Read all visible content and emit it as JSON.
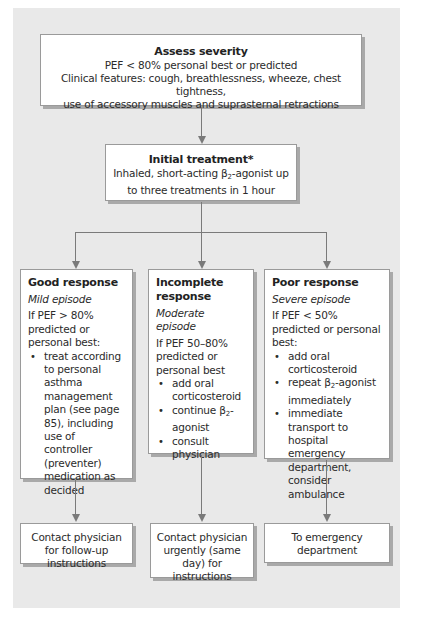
{
  "diagram": {
    "type": "flowchart",
    "colors": {
      "panel_bg": "#e9e9e9",
      "box_bg": "#ffffff",
      "connector": "#7a7a7a",
      "shadow": "#a9a9a9"
    },
    "assess": {
      "title": "Assess severity",
      "line1": "PEF < 80% personal best or predicted",
      "line2": "Clinical features: cough, breathlessness, wheeze, chest tightness,",
      "line3": "use of accessory muscles and suprasternal retractions"
    },
    "initial": {
      "title": "Initial treatment*",
      "line1_pre": "Inhaled, short-acting β",
      "line1_sub": "2",
      "line1_post": "-agonist up",
      "line2": "to three treatments in 1 hour"
    },
    "good": {
      "title": "Good response",
      "subtitle": "Mild episode",
      "condition": "If PEF > 80% predicted or personal best:",
      "bullets": [
        "treat according to personal asthma management plan (see page 85), including use of controller (preventer) medication as decided"
      ],
      "outcome": "Contact physician for follow-up instructions"
    },
    "incomplete": {
      "title": "Incomplete response",
      "subtitle": "Moderate episode",
      "condition": "If PEF 50–80% predicted or personal best",
      "bullets": [
        "add oral corticosteroid",
        {
          "pre": "continue β",
          "sub": "2",
          "post": "-agonist"
        },
        "consult physician"
      ],
      "bullet2_pre": "continue β",
      "bullet2_sub": "2",
      "bullet2_post": "-agonist",
      "outcome": "Contact physician urgently (same day) for instructions"
    },
    "poor": {
      "title": "Poor response",
      "subtitle": "Severe episode",
      "condition": "If PEF < 50% predicted or personal best:",
      "bullets": [
        "add oral corticosteroid",
        {
          "pre": "repeat β",
          "sub": "2",
          "post": "-agonist immediately"
        },
        "immediate transport to hospital emergency department, consider ambulance"
      ],
      "bullet2_pre": "repeat β",
      "bullet2_sub": "2",
      "bullet2_post": "-agonist immediately",
      "outcome": "To emergency department"
    }
  }
}
